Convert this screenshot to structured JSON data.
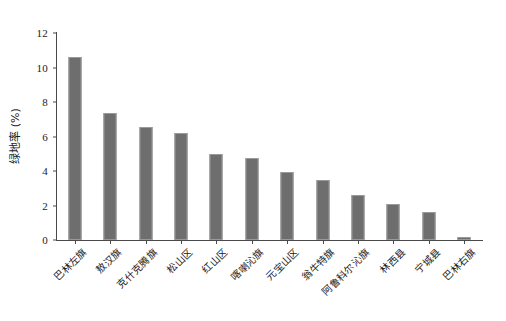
{
  "chart_data": {
    "type": "bar",
    "title": "",
    "subtitle": "",
    "xlabel": "",
    "ylabel": "绿地率 (%)",
    "ylim": [
      0,
      12
    ],
    "yticks": [
      0,
      2,
      4,
      6,
      8,
      10,
      12
    ],
    "ytick_labels": [
      "0",
      "2",
      "4",
      "6",
      "8",
      "10",
      "12"
    ],
    "grid": false,
    "legend": null,
    "legend_position": "none",
    "bar_color": "#6E6E6E",
    "bar_edge_color": "#9A9A9A",
    "axis_color": "#4A4A4A",
    "background_color": "#FFFFFF",
    "xtick_rotation": -45,
    "categories": [
      "巴林左旗",
      "敖汉旗",
      "克什克腾旗",
      "松山区",
      "红山区",
      "喀喇沁旗",
      "元宝山区",
      "翁牛特旗",
      "阿鲁科尔沁旗",
      "林西县",
      "宁城县",
      "巴林右旗"
    ],
    "values": [
      10.6,
      7.35,
      6.55,
      6.2,
      5.0,
      4.75,
      3.95,
      3.5,
      2.6,
      2.1,
      1.65,
      0.15
    ]
  }
}
